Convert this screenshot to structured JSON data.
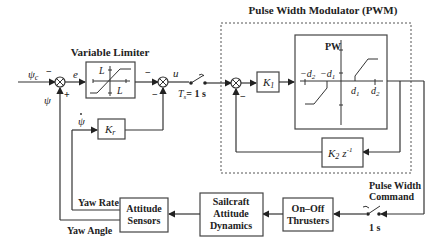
{
  "labels": {
    "variable_limiter": "Variable Limiter",
    "pwm": "Pulse Width Modulator (PWM)",
    "pulse_width_command_1": "Pulse Width",
    "pulse_width_command_2": "Command",
    "sample_time": "T",
    "sample_time_sub": "s",
    "sample_time_val": "= 1 s",
    "switch2_time": "1 s",
    "yaw_rate": "Yaw Rate",
    "yaw_angle": "Yaw Angle"
  },
  "signals": {
    "psi_c": "ψ",
    "psi_c_sub": "c",
    "e": "e",
    "u": "u",
    "psi": "ψ",
    "psi_dot": "ψ",
    "minus": "−",
    "plus": "+"
  },
  "blocks": {
    "limiter_L_top": "L",
    "limiter_L_right": "L",
    "k1": "K",
    "k1_sub": "1",
    "kr": "K",
    "kr_sub": "r",
    "k2": "K",
    "k2_sub": "2",
    "z": "z",
    "z_sup": "-1",
    "pw_axis": "PW",
    "neg_d2": "−d",
    "neg_d2_sub": "2",
    "neg_d1": "−d",
    "neg_d1_sub": "1",
    "d1": "d",
    "d1_sub": "1",
    "d2": "d",
    "d2_sub": "2",
    "attitude_sensors_1": "Attitude",
    "attitude_sensors_2": "Sensors",
    "sailcraft_1": "Sailcraft",
    "sailcraft_2": "Attitude",
    "sailcraft_3": "Dynamics",
    "thrusters_1": "On–Off",
    "thrusters_2": "Thrusters"
  }
}
